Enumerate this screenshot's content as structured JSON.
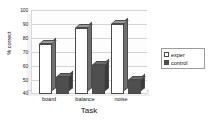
{
  "chart_data": {
    "type": "bar",
    "title": "",
    "xlabel": "Task",
    "ylabel": "% correct",
    "categories": [
      "board",
      "balance",
      "noise"
    ],
    "series": [
      {
        "name": "exper",
        "values": [
          76,
          87,
          90
        ],
        "color": "#ffffff"
      },
      {
        "name": "control",
        "values": [
          52,
          61,
          50
        ],
        "color": "#4f4f4f"
      }
    ],
    "ylim": [
      40,
      100
    ],
    "yticks": [
      40,
      50,
      60,
      70,
      80,
      90,
      100
    ],
    "ytick_labels": [
      "40",
      "50",
      "60",
      "70",
      "80",
      "90",
      "100"
    ],
    "grid": true,
    "legend_position": "right",
    "style": "3d-clustered-column"
  },
  "legend": {
    "entries": [
      {
        "label": "exper"
      },
      {
        "label": "control"
      }
    ]
  },
  "axes": {
    "y_title": "% correct",
    "x_title": "Task",
    "y_tick_labels": [
      "100",
      "90",
      "80",
      "70",
      "60",
      "50",
      "40"
    ],
    "x_tick_labels": [
      "board",
      "balance",
      "noise"
    ]
  }
}
